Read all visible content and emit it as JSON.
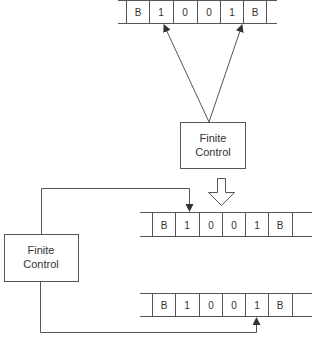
{
  "diagram": {
    "top": {
      "tape": {
        "cells": [
          "B",
          "1",
          "0",
          "0",
          "1",
          "B"
        ]
      },
      "finite_control": {
        "line1": "Finite",
        "line2": "Control"
      },
      "heads": [
        "head-on-cell-1",
        "head-on-cell-4"
      ]
    },
    "transition_arrow": "hollow-down-arrow",
    "bottom": {
      "finite_control": {
        "line1": "Finite",
        "line2": "Control"
      },
      "tape1": {
        "cells": [
          "B",
          "1",
          "0",
          "0",
          "1",
          "B"
        ],
        "head_cell_index": 1
      },
      "tape2": {
        "cells": [
          "B",
          "1",
          "0",
          "0",
          "1",
          "B"
        ],
        "head_cell_index": 4
      }
    },
    "colors": {
      "line": "#555555",
      "text": "#333333",
      "background": "#ffffff"
    }
  }
}
